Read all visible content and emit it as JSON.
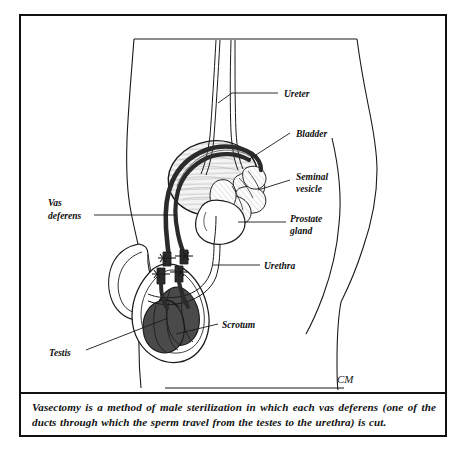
{
  "figure": {
    "signature": "CM",
    "caption": "Vasectomy is a method of male sterilization in which each vas deferens (one of the ducts through which the sperm travel from the testes to the urethra) is cut.",
    "colors": {
      "ink": "#0d0d0d",
      "border": "#111111",
      "testis_fill": "#4a4a4a",
      "vas_fill": "#2b2b2b",
      "bladder_fill": "#f2f2f2",
      "background": "#ffffff"
    },
    "labels": [
      {
        "id": "ureter",
        "text": "Ureter",
        "x": 284,
        "y": 94
      },
      {
        "id": "bladder",
        "text": "Bladder",
        "x": 296,
        "y": 134
      },
      {
        "id": "seminal-vesicle",
        "line1": "Seminal",
        "line2": "vesicle",
        "x": 296,
        "y": 180
      },
      {
        "id": "prostate-gland",
        "line1": "Prostate",
        "line2": "gland",
        "x": 290,
        "y": 224
      },
      {
        "id": "urethra",
        "text": "Urethra",
        "x": 264,
        "y": 266
      },
      {
        "id": "vas-deferens",
        "line1": "Vas",
        "line2": "deferens",
        "x": 48,
        "y": 206
      },
      {
        "id": "scrotum",
        "text": "Scrotum",
        "x": 222,
        "y": 325
      },
      {
        "id": "testis",
        "text": "Testis",
        "x": 49,
        "y": 353
      }
    ]
  }
}
